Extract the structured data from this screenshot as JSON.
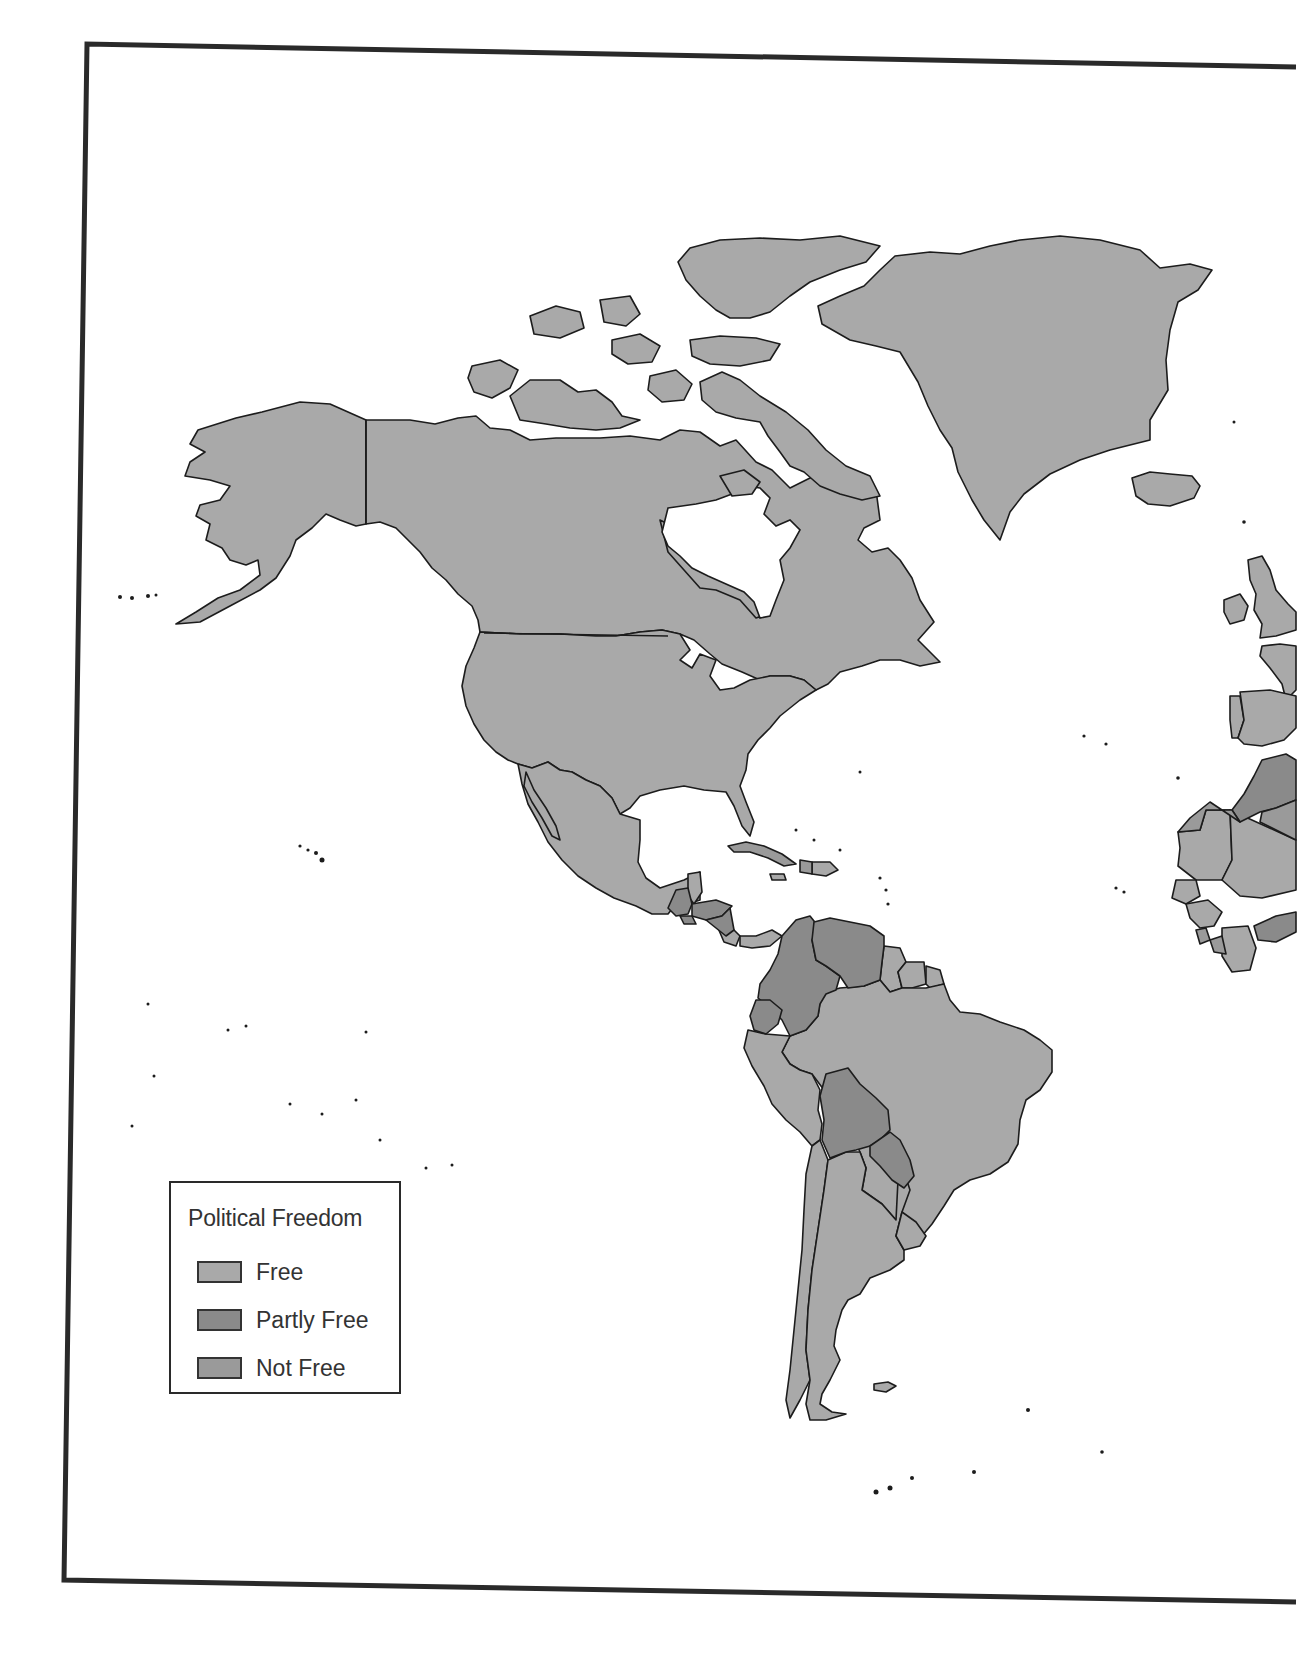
{
  "legend": {
    "title": "Political Freedom",
    "items": [
      {
        "label": "Free",
        "color": "#a9a9a9"
      },
      {
        "label": "Partly Free",
        "color": "#8a8a8a"
      },
      {
        "label": "Not Free",
        "color": "#9a9a9a"
      }
    ]
  },
  "colors": {
    "free": "#a9a9a9",
    "partly_free": "#8a8a8a",
    "not_free": "#9a9a9a",
    "outline": "#1c1c1c",
    "frame": "#2a2a2a",
    "ocean": "#ffffff"
  },
  "regions": {
    "free": [
      "Alaska (USA)",
      "Canada",
      "Canadian Arctic Archipelago",
      "Greenland",
      "Iceland",
      "United States",
      "Mexico",
      "Belize",
      "Costa Rica",
      "Panama",
      "Dominican Republic",
      "Jamaica",
      "Guyana",
      "Suriname",
      "French Guiana",
      "Brazil",
      "Peru",
      "Chile",
      "Argentina",
      "Uruguay",
      "Ireland",
      "United Kingdom",
      "France",
      "Spain",
      "Portugal",
      "Mauritania",
      "Mali",
      "Senegal",
      "Guinea",
      "Côte d'Ivoire"
    ],
    "partly_free": [
      "Guatemala",
      "Honduras",
      "Nicaragua",
      "El Salvador",
      "Colombia",
      "Venezuela",
      "Ecuador",
      "Bolivia",
      "Paraguay",
      "Morocco",
      "Burkina Faso"
    ],
    "not_free": [
      "Cuba",
      "Haiti",
      "Western Sahara",
      "Algeria",
      "Sierra Leone",
      "Liberia"
    ]
  }
}
